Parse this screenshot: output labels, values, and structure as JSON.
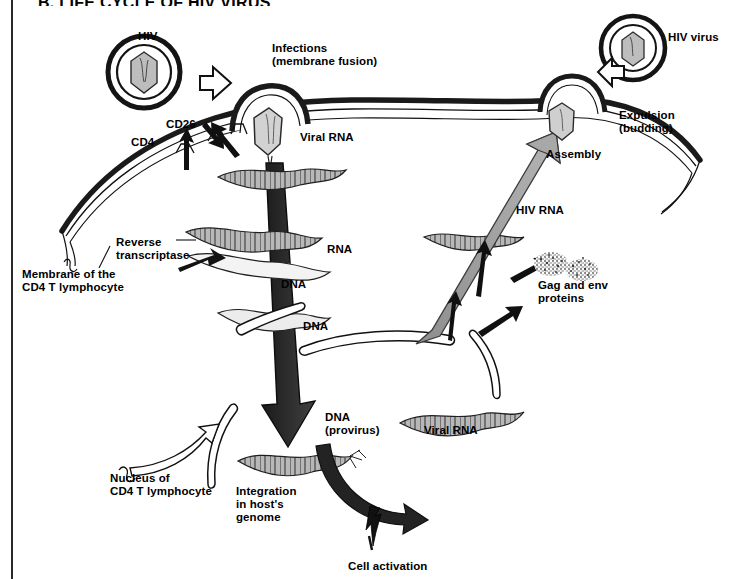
{
  "figure": {
    "title": "B. LIFE CYCLE OF HIV VIRUS",
    "kind": "scientific-diagram",
    "colors": {
      "ink": "#000000",
      "paper": "#ffffff",
      "rule": "#2a2a2a",
      "gray_arrow": "#9a9a9a",
      "dark_arrow": "#1c1c1c",
      "capsid_fill": "#c9c9c9",
      "nucleic_fill": "#b5b5b5"
    }
  },
  "labels": {
    "hiv_left": "HIV",
    "hiv_right": "HIV virus",
    "infection": "Infections\n(membrane fusion)",
    "cd4": "CD4",
    "cd26": "CD26",
    "membrane": "Membrane of the\nCD4 T lymphocyte",
    "viral_rna_top": "Viral RNA",
    "reverse_transcriptase": "Reverse\ntranscriptase",
    "rna": "RNA",
    "dna_upper": "DNA",
    "dna_lower": "DNA",
    "dna_provirus": "DNA\n(provirus)",
    "nucleus": "Nucleus of\nCD4 T lymphocyte",
    "integration": "Integration\nin host's\ngenome",
    "cell_activation": "Cell activation",
    "viral_rna_bottom": "Viral RNA",
    "hiv_rna": "HIV RNA",
    "gag_env": "Gag and env\nproteins",
    "assembly": "Assembly",
    "expulsion": "Expulsion\n(budding)"
  },
  "icons": {
    "virion_left": "hiv-virion-icon",
    "virion_right": "hiv-virion-icon",
    "entry_arrow": "hollow-arrow-right-icon",
    "exit_arrow": "hollow-arrow-left-icon",
    "transcription_arrow": "large-down-arrow-icon",
    "assembly_arrow": "large-up-arrow-icon",
    "activation_arrow": "curved-arrow-icon",
    "lightning": "lightning-bolt-icon"
  }
}
